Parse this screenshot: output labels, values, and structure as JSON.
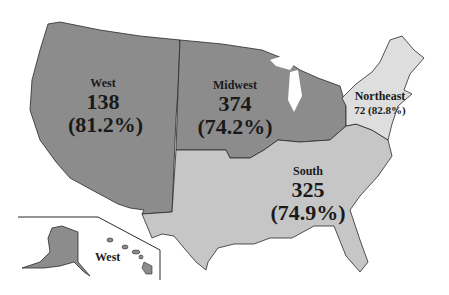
{
  "colors": {
    "west": "#8c8c8c",
    "midwest": "#8c8c8c",
    "south": "#c6c6c6",
    "northeast": "#dedede",
    "border": "#2a2a2a",
    "state_lines": "#6a6a6a"
  },
  "regions": {
    "west": {
      "name": "West",
      "count": "138",
      "percent": "(81.2%)"
    },
    "midwest": {
      "name": "Midwest",
      "count": "374",
      "percent": "(74.2%)"
    },
    "south": {
      "name": "South",
      "count": "325",
      "percent": "(74.9%)"
    },
    "northeast": {
      "name": "Northeast",
      "count_percent": "72 (82.8%)"
    }
  },
  "inset": {
    "label": "West"
  }
}
